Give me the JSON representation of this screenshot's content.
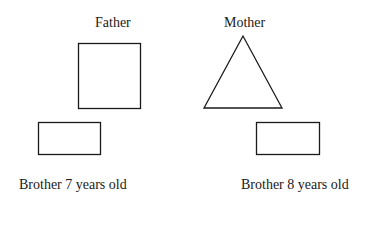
{
  "diagram": {
    "colors": {
      "stroke": "#1a1a1a",
      "background": "#ffffff"
    },
    "nodes": [
      {
        "id": "father",
        "label": "Father",
        "shape": "square"
      },
      {
        "id": "mother",
        "label": "Mother",
        "shape": "triangle"
      },
      {
        "id": "brother1",
        "label": "Brother 7 years old",
        "shape": "rectangle"
      },
      {
        "id": "brother2",
        "label": "Brother 8 years old",
        "shape": "rectangle"
      }
    ]
  }
}
